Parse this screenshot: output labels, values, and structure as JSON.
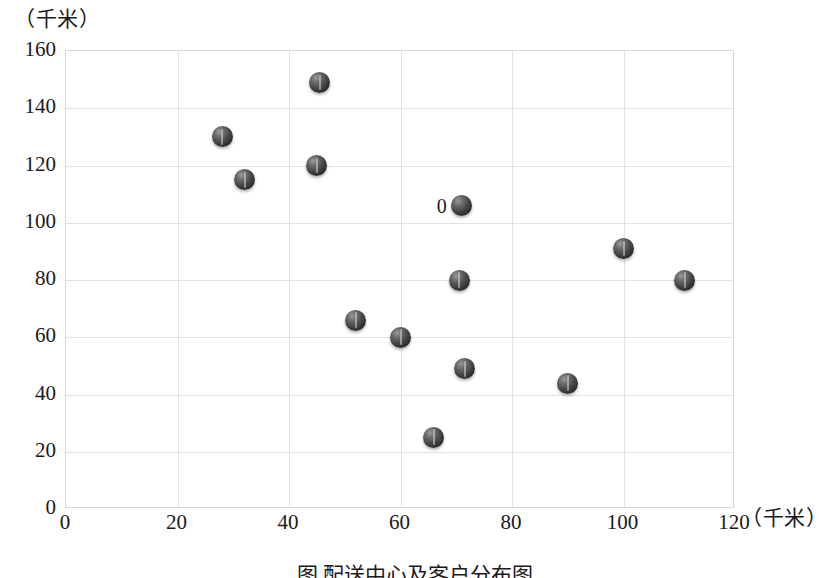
{
  "figure": {
    "caption": "图  配送中心及客户分布图",
    "background_color": "#ffffff",
    "frame_color": "#d8d8d8",
    "grid_color": "#e2e2e2",
    "marker_color": "#3a3a3a"
  },
  "chart_data": {
    "type": "scatter",
    "title": "",
    "xlabel": "（千米）",
    "ylabel": "（千米）",
    "xlim": [
      0,
      120
    ],
    "ylim": [
      0,
      160
    ],
    "xticks": [
      0,
      20,
      40,
      60,
      80,
      100,
      120
    ],
    "yticks": [
      0,
      20,
      40,
      60,
      80,
      100,
      120,
      140,
      160
    ],
    "grid": true,
    "legend": "none",
    "points": [
      {
        "x": 28,
        "y": 130,
        "label": ""
      },
      {
        "x": 32,
        "y": 115,
        "label": ""
      },
      {
        "x": 45.5,
        "y": 149,
        "label": ""
      },
      {
        "x": 45,
        "y": 120,
        "label": ""
      },
      {
        "x": 71,
        "y": 106,
        "label": "0"
      },
      {
        "x": 100,
        "y": 91,
        "label": ""
      },
      {
        "x": 111,
        "y": 80,
        "label": ""
      },
      {
        "x": 70.5,
        "y": 80,
        "label": ""
      },
      {
        "x": 52,
        "y": 66,
        "label": ""
      },
      {
        "x": 60,
        "y": 60,
        "label": ""
      },
      {
        "x": 71.5,
        "y": 49,
        "label": ""
      },
      {
        "x": 90,
        "y": 44,
        "label": ""
      },
      {
        "x": 66,
        "y": 25,
        "label": ""
      }
    ],
    "annotations": [
      {
        "x": 71,
        "y": 106,
        "text": "0"
      }
    ]
  }
}
